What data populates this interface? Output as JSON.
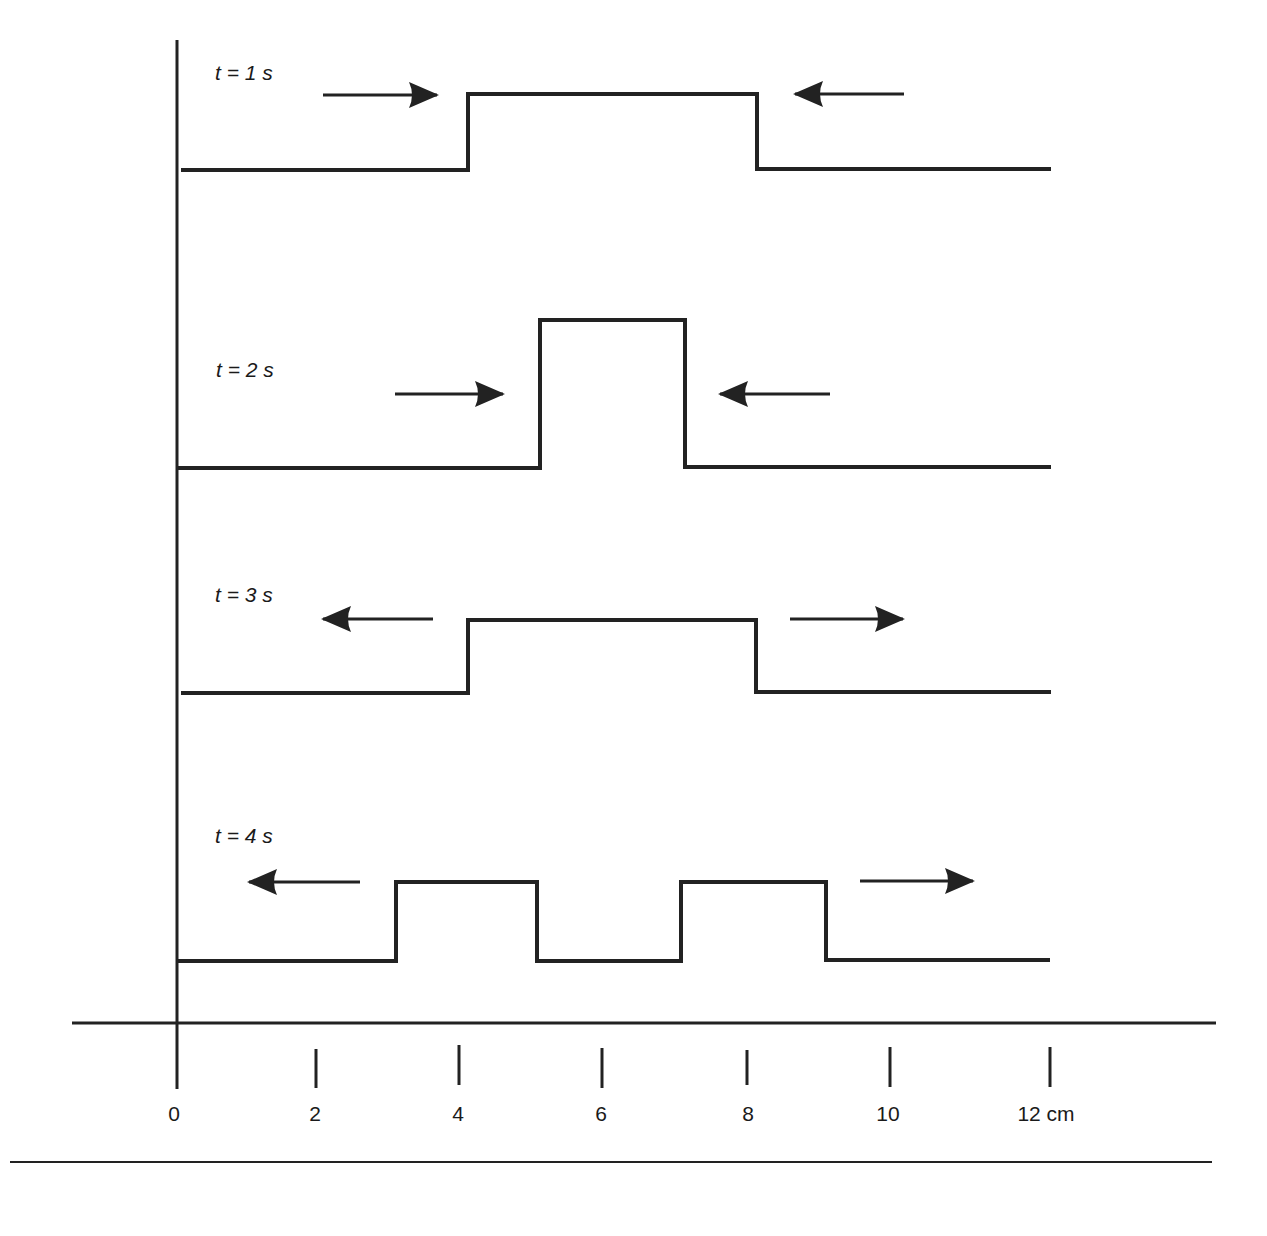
{
  "diagram": {
    "title": "",
    "unit": "cm",
    "colors": {
      "ink": "#222222",
      "background": "#ffffff"
    },
    "x_axis": {
      "ticks": [
        {
          "value": 0,
          "label": "0"
        },
        {
          "value": 2,
          "label": "2"
        },
        {
          "value": 4,
          "label": "4"
        },
        {
          "value": 6,
          "label": "6"
        },
        {
          "value": 8,
          "label": "8"
        },
        {
          "value": 10,
          "label": "10"
        },
        {
          "value": 12,
          "label": "12 cm"
        }
      ]
    },
    "snapshots": [
      {
        "label": "t = 1 s",
        "pulses": [
          {
            "start_cm": 4,
            "end_cm": 8,
            "height": "low"
          }
        ],
        "arrows": [
          {
            "direction": "right",
            "from_cm": 2,
            "to_cm": 3.6
          },
          {
            "direction": "left",
            "from_cm": 10.1,
            "to_cm": 8.5
          }
        ]
      },
      {
        "label": "t = 2 s",
        "pulses": [
          {
            "start_cm": 5,
            "end_cm": 7,
            "height": "double"
          }
        ],
        "arrows": [
          {
            "direction": "right",
            "from_cm": 3,
            "to_cm": 4.5
          },
          {
            "direction": "left",
            "from_cm": 9,
            "to_cm": 7.5
          }
        ]
      },
      {
        "label": "t = 3 s",
        "pulses": [
          {
            "start_cm": 4,
            "end_cm": 8,
            "height": "low"
          }
        ],
        "arrows": [
          {
            "direction": "left",
            "from_cm": 3.5,
            "to_cm": 2
          },
          {
            "direction": "right",
            "from_cm": 8.5,
            "to_cm": 10
          }
        ]
      },
      {
        "label": "t = 4 s",
        "pulses": [
          {
            "start_cm": 3,
            "end_cm": 5,
            "height": "low"
          },
          {
            "start_cm": 7,
            "end_cm": 9,
            "height": "low"
          }
        ],
        "arrows": [
          {
            "direction": "left",
            "from_cm": 2.5,
            "to_cm": 1
          },
          {
            "direction": "right",
            "from_cm": 9.5,
            "to_cm": 11
          }
        ]
      }
    ]
  }
}
